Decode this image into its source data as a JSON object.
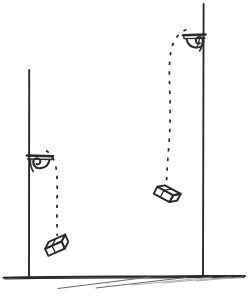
{
  "figure": {
    "title": "Two erasers falling from wall brackets at different heights",
    "style": "hand-drawn pen sketch",
    "width": 248,
    "height": 297,
    "background_color": "#ffffff",
    "ink_color": "#2b2b2b",
    "ground_shadow_color": "#6a6a6a"
  },
  "scene": {
    "ground_label": "ground-line",
    "posts": [
      {
        "name": "left-post",
        "label": "Left vertical post",
        "x": 29,
        "y_top": 70,
        "y_bottom": 277,
        "height_px": 207
      },
      {
        "name": "right-post",
        "label": "Right vertical post",
        "x": 203,
        "y_top": 4,
        "y_bottom": 277,
        "height_px": 273
      }
    ],
    "brackets": [
      {
        "name": "left-bracket",
        "label": "Lower ornamental wall bracket",
        "attached_to": "left-post",
        "x": 29,
        "y": 157,
        "facing": "right",
        "drop_height_px": 120
      },
      {
        "name": "right-bracket",
        "label": "Upper ornamental wall bracket",
        "attached_to": "right-post",
        "x": 203,
        "y": 36,
        "facing": "left",
        "drop_height_px": 241
      }
    ],
    "trajectories": [
      {
        "name": "left-trajectory",
        "label": "Short dashed fall path",
        "style": "dashed",
        "from_bracket": "left-bracket",
        "to_block": "left-block",
        "start": [
          47,
          152
        ],
        "end": [
          57,
          236
        ]
      },
      {
        "name": "right-trajectory",
        "label": "Long dashed fall path",
        "style": "dashed",
        "from_bracket": "right-bracket",
        "to_block": "right-block",
        "start": [
          185,
          31
        ],
        "end": [
          167,
          181
        ]
      }
    ],
    "blocks": [
      {
        "name": "left-block",
        "label": "Eraser near ground (left)",
        "shape": "3d-rectangular-block",
        "center": [
          57,
          247
        ],
        "rotation_deg": -24,
        "width_px": 26,
        "height_px": 12
      },
      {
        "name": "right-block",
        "label": "Eraser mid-fall (right)",
        "shape": "3d-rectangular-block",
        "center": [
          166,
          195
        ],
        "rotation_deg": 28,
        "width_px": 26,
        "height_px": 12
      }
    ],
    "ground": {
      "name": "ground",
      "label": "Ground surface line",
      "y": 277,
      "x_start": 3,
      "x_end": 245,
      "hatch_stroke_count": 5
    }
  }
}
